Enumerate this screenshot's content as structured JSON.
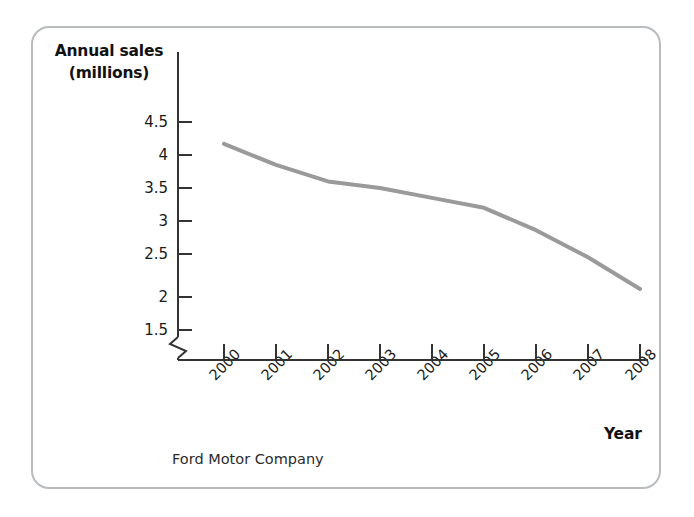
{
  "figure": {
    "caption": "Ford Motor Company",
    "frame_color": "#b9bcbe",
    "background": "#ffffff"
  },
  "chart_data": {
    "type": "line",
    "title": "",
    "subtitle": "",
    "caption": "Ford Motor Company",
    "xlabel": "Year",
    "ylabel": "Annual sales (millions)",
    "ylabel_line1": "Annual sales",
    "ylabel_line2": "(millions)",
    "categories": [
      "2000",
      "2001",
      "2002",
      "2003",
      "2004",
      "2005",
      "2006",
      "2007",
      "2008"
    ],
    "x": [
      2000,
      2001,
      2002,
      2003,
      2004,
      2005,
      2006,
      2007,
      2008
    ],
    "values": [
      4.17,
      3.85,
      3.6,
      3.5,
      3.35,
      3.2,
      2.86,
      2.45,
      1.97
    ],
    "series": [
      {
        "name": "Annual sales",
        "color": "#9a9a9a",
        "line_width": 4,
        "values": [
          4.17,
          3.85,
          3.6,
          3.5,
          3.35,
          3.2,
          2.86,
          2.45,
          1.97
        ]
      }
    ],
    "ylim": [
      1.5,
      4.5
    ],
    "yticks": [
      4.5,
      4,
      3.5,
      3,
      2.5,
      2,
      1.5
    ],
    "ytick_labels": [
      "4.5",
      "4",
      "3.5",
      "3",
      "2.5",
      "2",
      "1.5"
    ],
    "xtick_labels": [
      "2000",
      "2001",
      "2002",
      "2003",
      "2004",
      "2005",
      "2006",
      "2007",
      "2008"
    ],
    "xtick_rotation": -45,
    "axis_break": true,
    "axis_break_position": "y-axis-below-1.5",
    "grid": false,
    "legend": false,
    "legend_position": "none",
    "axis_color": "#333333",
    "line_color": "#9a9a9a"
  },
  "geometry": {
    "x_tick_pixels": [
      224,
      276,
      328,
      380,
      432,
      484,
      536,
      588,
      640
    ],
    "y_tick_pixels": [
      122,
      155,
      188,
      221,
      254,
      297,
      330
    ],
    "axis_left": 178,
    "axis_bottom": 360
  }
}
